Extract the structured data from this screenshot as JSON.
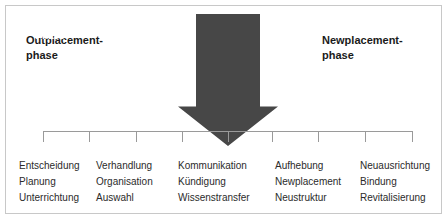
{
  "diagram": {
    "title_out": "Outplacement-\nphase",
    "title_new": "Newplacement-\nphase",
    "headings": [
      {
        "name": "outplacement",
        "line1": "Outplacement-",
        "line2": "phase"
      },
      {
        "name": "newplacement",
        "line1": "Newplacement-",
        "line2": "phase"
      }
    ],
    "arrow": {
      "line1": "Kündigungs-",
      "line2": "Phase",
      "color": "#474747",
      "direction": "down"
    },
    "axis": {
      "color": "#9a9a9a",
      "tick_positions": [
        0,
        46,
        93,
        139,
        185,
        229,
        275,
        322,
        369
      ]
    },
    "columns": [
      {
        "name": "entscheidung",
        "items": [
          "Entscheidung",
          "Planung",
          "Unterrichtung"
        ]
      },
      {
        "name": "verhandlung",
        "items": [
          "Verhandlung",
          "Organisation",
          "Auswahl"
        ]
      },
      {
        "name": "kommunikation",
        "items": [
          "Kommunikation",
          "Kündigung",
          "Wissenstransfer"
        ]
      },
      {
        "name": "aufhebung",
        "items": [
          "Aufhebung",
          "Newplacement",
          "Neustruktur"
        ]
      },
      {
        "name": "neuausrichtung",
        "items": [
          "Neuausrichtung",
          "Bindung",
          "Revitalisierung"
        ]
      }
    ]
  }
}
